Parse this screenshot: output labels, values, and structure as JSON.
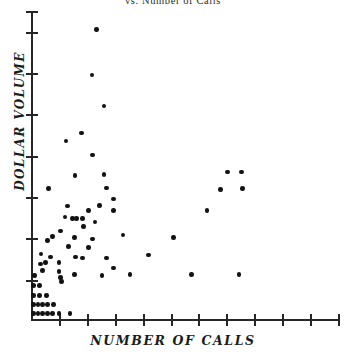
{
  "title": "vs. Number of Calls",
  "axis": {
    "x_label": "NUMBER OF CALLS",
    "y_label": "DOLLAR VOLUME"
  },
  "style": {
    "marker_color": "#121212",
    "axis_color": "#262626",
    "background": "#ffffff"
  },
  "chart_data": {
    "type": "scatter",
    "title": "vs. Number of Calls",
    "xlabel": "NUMBER OF CALLS",
    "ylabel": "DOLLAR VOLUME",
    "grid": false,
    "legend": null,
    "xlim": [
      0,
      11
    ],
    "ylim": [
      0,
      7.5
    ],
    "x_tick_count": 11,
    "y_tick_count": 8,
    "x_tick_labels": [],
    "y_tick_labels": [],
    "x_tick_interval": 1,
    "y_tick_interval": 1,
    "n_points": 71,
    "series": [
      {
        "name": "accounts",
        "points": [
          [
            0.08,
            0.18
          ],
          [
            0.25,
            0.18
          ],
          [
            0.42,
            0.18
          ],
          [
            0.6,
            0.18
          ],
          [
            0.78,
            0.18
          ],
          [
            1.0,
            0.18
          ],
          [
            1.4,
            0.18
          ],
          [
            0.08,
            0.4
          ],
          [
            0.25,
            0.4
          ],
          [
            0.42,
            0.4
          ],
          [
            0.6,
            0.4
          ],
          [
            0.8,
            0.4
          ],
          [
            0.08,
            0.62
          ],
          [
            0.3,
            0.62
          ],
          [
            0.55,
            0.62
          ],
          [
            0.08,
            0.86
          ],
          [
            0.3,
            0.86
          ],
          [
            0.12,
            1.1
          ],
          [
            0.42,
            1.22
          ],
          [
            1.0,
            1.2
          ],
          [
            1.0,
            1.42
          ],
          [
            1.05,
            1.05
          ],
          [
            1.55,
            1.12
          ],
          [
            2.55,
            1.1
          ],
          [
            2.95,
            1.28
          ],
          [
            3.55,
            1.12
          ],
          [
            5.75,
            1.12
          ],
          [
            7.45,
            1.12
          ],
          [
            0.36,
            1.62
          ],
          [
            0.7,
            1.55
          ],
          [
            1.6,
            1.55
          ],
          [
            1.85,
            1.52
          ],
          [
            2.05,
            1.78
          ],
          [
            2.7,
            1.52
          ],
          [
            0.78,
            2.05
          ],
          [
            0.6,
            1.95
          ],
          [
            1.35,
            1.8
          ],
          [
            1.55,
            2.02
          ],
          [
            2.2,
            1.98
          ],
          [
            3.3,
            2.08
          ],
          [
            5.1,
            2.02
          ],
          [
            1.22,
            2.52
          ],
          [
            1.48,
            2.48
          ],
          [
            1.62,
            2.48
          ],
          [
            1.85,
            2.48
          ],
          [
            1.88,
            2.28
          ],
          [
            2.05,
            2.68
          ],
          [
            1.3,
            2.78
          ],
          [
            2.45,
            2.8
          ],
          [
            2.95,
            2.68
          ],
          [
            2.95,
            2.95
          ],
          [
            0.62,
            3.2
          ],
          [
            2.7,
            3.22
          ],
          [
            6.3,
            2.68
          ],
          [
            6.8,
            3.18
          ],
          [
            1.58,
            3.52
          ],
          [
            2.62,
            3.55
          ],
          [
            7.05,
            3.6
          ],
          [
            7.55,
            3.6
          ],
          [
            7.58,
            3.2
          ],
          [
            1.25,
            4.35
          ],
          [
            2.2,
            4.02
          ],
          [
            1.8,
            4.55
          ],
          [
            2.62,
            5.2
          ],
          [
            2.18,
            5.95
          ],
          [
            2.35,
            7.05
          ],
          [
            1.05,
            2.18
          ],
          [
            0.52,
            1.42
          ],
          [
            0.34,
            1.38
          ],
          [
            2.3,
            2.4
          ],
          [
            4.2,
            1.6
          ],
          [
            1.1,
            0.95
          ]
        ]
      }
    ]
  }
}
